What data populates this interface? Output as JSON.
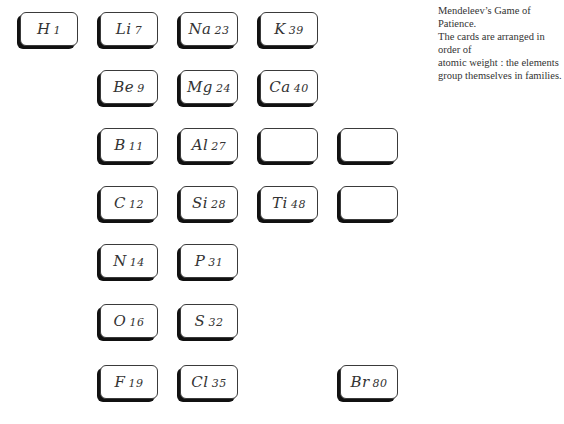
{
  "caption": {
    "line1": "Mendeleev’s Game of Patience.",
    "line2": "The cards are arranged in order of",
    "line3": "atomic weight : the elements",
    "line4": "group themselves in families."
  },
  "colors": {
    "card_border": "#3a3a3a",
    "card_shadow": "#111111",
    "text": "#333333",
    "background": "#ffffff"
  },
  "cards": {
    "h": {
      "symbol": "H",
      "weight": "1",
      "col": 0,
      "row": 0
    },
    "li": {
      "symbol": "Li",
      "weight": "7",
      "col": 1,
      "row": 0
    },
    "na": {
      "symbol": "Na",
      "weight": "23",
      "col": 2,
      "row": 0
    },
    "k": {
      "symbol": "K",
      "weight": "39",
      "col": 3,
      "row": 0
    },
    "be": {
      "symbol": "Be",
      "weight": "9",
      "col": 1,
      "row": 1
    },
    "mg": {
      "symbol": "Mg",
      "weight": "24",
      "col": 2,
      "row": 1
    },
    "ca": {
      "symbol": "Ca",
      "weight": "40",
      "col": 3,
      "row": 1
    },
    "b": {
      "symbol": "B",
      "weight": "11",
      "col": 1,
      "row": 2
    },
    "al": {
      "symbol": "Al",
      "weight": "27",
      "col": 2,
      "row": 2
    },
    "blank1": {
      "symbol": "",
      "weight": "",
      "col": 3,
      "row": 2
    },
    "blank2": {
      "symbol": "",
      "weight": "",
      "col": 4,
      "row": 2
    },
    "c": {
      "symbol": "C",
      "weight": "12",
      "col": 1,
      "row": 3
    },
    "si": {
      "symbol": "Si",
      "weight": "28",
      "col": 2,
      "row": 3
    },
    "ti": {
      "symbol": "Ti",
      "weight": "48",
      "col": 3,
      "row": 3
    },
    "blank3": {
      "symbol": "",
      "weight": "",
      "col": 4,
      "row": 3
    },
    "n": {
      "symbol": "N",
      "weight": "14",
      "col": 1,
      "row": 4
    },
    "p": {
      "symbol": "P",
      "weight": "31",
      "col": 2,
      "row": 4
    },
    "o": {
      "symbol": "O",
      "weight": "16",
      "col": 1,
      "row": 5
    },
    "s": {
      "symbol": "S",
      "weight": "32",
      "col": 2,
      "row": 5
    },
    "f": {
      "symbol": "F",
      "weight": "19",
      "col": 1,
      "row": 6
    },
    "cl": {
      "symbol": "Cl",
      "weight": "35",
      "col": 2,
      "row": 6
    },
    "br": {
      "symbol": "Br",
      "weight": "80",
      "col": 4,
      "row": 6
    }
  }
}
